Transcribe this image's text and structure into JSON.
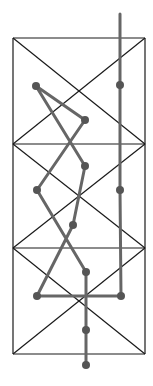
{
  "diagram": {
    "width": 153,
    "height": 386,
    "frame": {
      "stroke": "#1a1a1a",
      "stroke_width": 1.2,
      "left": 13,
      "right": 145,
      "top": 38,
      "bottom": 354,
      "dividers_y": [
        144,
        248
      ],
      "panels": [
        {
          "top": 38,
          "bottom": 144
        },
        {
          "top": 144,
          "bottom": 248
        },
        {
          "top": 248,
          "bottom": 354
        }
      ]
    },
    "path": {
      "stroke": "#666666",
      "stroke_width": 3,
      "points": [
        [
          120,
          14
        ],
        [
          120,
          85
        ],
        [
          120,
          190
        ],
        [
          121,
          296
        ],
        [
          37,
          296
        ],
        [
          73,
          225
        ],
        [
          85,
          166
        ],
        [
          36,
          86
        ],
        [
          85,
          120
        ],
        [
          37,
          190
        ],
        [
          86,
          272
        ],
        [
          86,
          330
        ],
        [
          86,
          365
        ]
      ]
    },
    "nodes": {
      "fill": "#555555",
      "radius": 4,
      "points": [
        [
          120,
          85
        ],
        [
          120,
          190
        ],
        [
          121,
          296
        ],
        [
          37,
          296
        ],
        [
          73,
          225
        ],
        [
          85,
          166
        ],
        [
          36,
          86
        ],
        [
          85,
          120
        ],
        [
          37,
          190
        ],
        [
          86,
          272
        ],
        [
          86,
          330
        ],
        [
          86,
          365
        ]
      ]
    }
  }
}
